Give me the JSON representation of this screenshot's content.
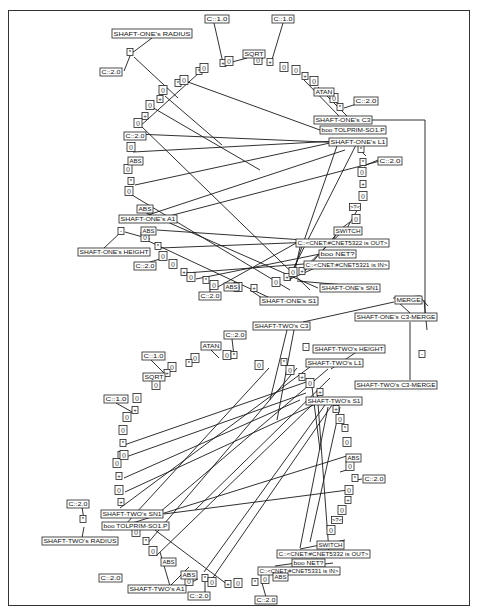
{
  "colors": {
    "line": "#1a1a1a",
    "box_border": "#222222",
    "background": "#ffffff"
  },
  "labels": [
    {
      "id": "s1_radius",
      "text": "SHAFT-ONE's RADIUS",
      "x": 112,
      "y": 29,
      "w": 80,
      "h": 9
    },
    {
      "id": "s1_c1a",
      "text": "C::1.0",
      "x": 205,
      "y": 15,
      "w": 24,
      "h": 8
    },
    {
      "id": "s1_c1b",
      "text": "C::1.0",
      "x": 272,
      "y": 15,
      "w": 22,
      "h": 8
    },
    {
      "id": "s1_sqrt",
      "text": "SQRT",
      "x": 243,
      "y": 50,
      "w": 22,
      "h": 8
    },
    {
      "id": "s1_c2a",
      "text": "C::2.0",
      "x": 100,
      "y": 68,
      "w": 22,
      "h": 8
    },
    {
      "id": "s1_atan",
      "text": "ATAN",
      "x": 314,
      "y": 88,
      "w": 20,
      "h": 8
    },
    {
      "id": "s1_c2b",
      "text": "C::2.0",
      "x": 354,
      "y": 97,
      "w": 24,
      "h": 8
    },
    {
      "id": "s1_c3",
      "text": "SHAFT-ONE's C3",
      "x": 314,
      "y": 116,
      "w": 58,
      "h": 8
    },
    {
      "id": "s1_tolprim",
      "text": "boo TOLPRIM-SO1.P",
      "x": 320,
      "y": 126,
      "w": 66,
      "h": 8
    },
    {
      "id": "s1_l1",
      "text": "SHAFT-ONE's L1",
      "x": 329,
      "y": 138,
      "w": 58,
      "h": 8
    },
    {
      "id": "s1_c2c",
      "text": "C::2.0",
      "x": 124,
      "y": 132,
      "w": 22,
      "h": 8
    },
    {
      "id": "s1_abs1",
      "text": "ABS",
      "x": 128,
      "y": 157,
      "w": 15,
      "h": 8
    },
    {
      "id": "s1_c2d",
      "text": "C::2.0",
      "x": 378,
      "y": 157,
      "w": 24,
      "h": 8
    },
    {
      "id": "s1_abs2",
      "text": "ABS",
      "x": 137,
      "y": 205,
      "w": 16,
      "h": 8
    },
    {
      "id": "s1_a1",
      "text": "SHAFT-ONE's A1",
      "x": 119,
      "y": 215,
      "w": 58,
      "h": 8
    },
    {
      "id": "s1_abs3",
      "text": "ABS",
      "x": 141,
      "y": 227,
      "w": 15,
      "h": 8
    },
    {
      "id": "s1_height",
      "text": "SHAFT-ONE's HEIGHT",
      "x": 78,
      "y": 248,
      "w": 72,
      "h": 8
    },
    {
      "id": "s1_c2e",
      "text": "C::2.0",
      "x": 134,
      "y": 262,
      "w": 22,
      "h": 8
    },
    {
      "id": "s1_switch",
      "text": "SWITCH",
      "x": 334,
      "y": 227,
      "w": 28,
      "h": 8
    },
    {
      "id": "s1_out",
      "text": "C::<CNET:#CNET5322 is OUT>",
      "x": 296,
      "y": 239,
      "w": 93,
      "h": 8
    },
    {
      "id": "s1_net",
      "text": "boo NET?",
      "x": 319,
      "y": 250,
      "w": 37,
      "h": 8
    },
    {
      "id": "s1_in",
      "text": "C::<CNET:#CNET5321 is IN>",
      "x": 304,
      "y": 261,
      "w": 85,
      "h": 8
    },
    {
      "id": "s1_abs4",
      "text": "ABS",
      "x": 224,
      "y": 283,
      "w": 15,
      "h": 8
    },
    {
      "id": "s1_c2f",
      "text": "C::2.0",
      "x": 199,
      "y": 292,
      "w": 22,
      "h": 8
    },
    {
      "id": "s1_sn1",
      "text": "SHAFT-ONE's SN1",
      "x": 320,
      "y": 284,
      "w": 60,
      "h": 8
    },
    {
      "id": "s1_s1",
      "text": "SHAFT-ONE's S1",
      "x": 260,
      "y": 297,
      "w": 58,
      "h": 8
    },
    {
      "id": "merge",
      "text": "MERGE",
      "x": 395,
      "y": 296,
      "w": 27,
      "h": 8
    },
    {
      "id": "s1_c3merge",
      "text": "SHAFT-ONE's C3-MERGE",
      "x": 355,
      "y": 313,
      "w": 82,
      "h": 8
    },
    {
      "id": "s2_c3",
      "text": "SHAFT-TWO's C3",
      "x": 253,
      "y": 322,
      "w": 57,
      "h": 8
    },
    {
      "id": "s2_c2a",
      "text": "C::2.0",
      "x": 224,
      "y": 331,
      "w": 22,
      "h": 8
    },
    {
      "id": "s2_atan",
      "text": "ATAN",
      "x": 201,
      "y": 342,
      "w": 20,
      "h": 8
    },
    {
      "id": "s2_height",
      "text": "SHAFT-TWO's HEIGHT",
      "x": 313,
      "y": 345,
      "w": 72,
      "h": 8
    },
    {
      "id": "s2_c1a",
      "text": "C::1.0",
      "x": 142,
      "y": 352,
      "w": 23,
      "h": 8
    },
    {
      "id": "s2_l1",
      "text": "SHAFT-TWO's L1",
      "x": 306,
      "y": 359,
      "w": 57,
      "h": 8
    },
    {
      "id": "s2_sqrt",
      "text": "SQRT",
      "x": 143,
      "y": 373,
      "w": 22,
      "h": 8
    },
    {
      "id": "s2_c1b",
      "text": "C::1.0",
      "x": 104,
      "y": 395,
      "w": 24,
      "h": 8
    },
    {
      "id": "s2_c3merge",
      "text": "SHAFT-TWO's C3-MERGE",
      "x": 355,
      "y": 381,
      "w": 82,
      "h": 8
    },
    {
      "id": "s2_s1",
      "text": "SHAFT-TWO's S1",
      "x": 306,
      "y": 397,
      "w": 56,
      "h": 8
    },
    {
      "id": "s2_abs1",
      "text": "ABS",
      "x": 346,
      "y": 454,
      "w": 15,
      "h": 8
    },
    {
      "id": "s2_c2b",
      "text": "C::2.0",
      "x": 363,
      "y": 475,
      "w": 22,
      "h": 8
    },
    {
      "id": "s2_c2c",
      "text": "C::2.0",
      "x": 67,
      "y": 500,
      "w": 22,
      "h": 8
    },
    {
      "id": "s2_sn1",
      "text": "SHAFT-TWO's SN1",
      "x": 101,
      "y": 510,
      "w": 62,
      "h": 8
    },
    {
      "id": "s2_tolprim",
      "text": "boo TOLPRIM-SO1.P",
      "x": 102,
      "y": 522,
      "w": 67,
      "h": 8
    },
    {
      "id": "s2_radius",
      "text": "SHAFT-TWO's RADIUS",
      "x": 42,
      "y": 537,
      "w": 76,
      "h": 8
    },
    {
      "id": "s2_switch",
      "text": "SWITCH",
      "x": 317,
      "y": 541,
      "w": 27,
      "h": 8
    },
    {
      "id": "s2_out",
      "text": "C::<CNET:#CNET5332 is OUT>",
      "x": 277,
      "y": 550,
      "w": 93,
      "h": 8
    },
    {
      "id": "s2_net",
      "text": "boo NET?",
      "x": 292,
      "y": 559,
      "w": 33,
      "h": 8
    },
    {
      "id": "s2_in",
      "text": "C::<CNET:#CNET5331 is IN>",
      "x": 258,
      "y": 567,
      "w": 82,
      "h": 8
    },
    {
      "id": "s2_abs2",
      "text": "ABS",
      "x": 161,
      "y": 558,
      "w": 15,
      "h": 8
    },
    {
      "id": "s2_abs3",
      "text": "ABS",
      "x": 181,
      "y": 571,
      "w": 16,
      "h": 8
    },
    {
      "id": "s2_abs4",
      "text": "ABS",
      "x": 273,
      "y": 573,
      "w": 15,
      "h": 8
    },
    {
      "id": "s2_c2d",
      "text": "C::2.0",
      "x": 99,
      "y": 574,
      "w": 23,
      "h": 8
    },
    {
      "id": "s2_a1",
      "text": "SHAFT-TWO's A1",
      "x": 128,
      "y": 585,
      "w": 58,
      "h": 8
    },
    {
      "id": "s2_c2e",
      "text": "C::2.0",
      "x": 188,
      "y": 592,
      "w": 22,
      "h": 8
    },
    {
      "id": "s2_c2f",
      "text": "C::2.0",
      "x": 255,
      "y": 596,
      "w": 22,
      "h": 8
    }
  ],
  "operators": [
    {
      "t": "*",
      "x": 130,
      "y": 52
    },
    {
      "t": "*",
      "x": 199,
      "y": 71
    },
    {
      "t": "()",
      "x": 204,
      "y": 68
    },
    {
      "t": "+",
      "x": 223,
      "y": 63
    },
    {
      "t": "()",
      "x": 229,
      "y": 61
    },
    {
      "t": "()",
      "x": 258,
      "y": 60
    },
    {
      "t": "+",
      "x": 270,
      "y": 62
    },
    {
      "t": "()",
      "x": 284,
      "y": 67
    },
    {
      "t": "()",
      "x": 296,
      "y": 70
    },
    {
      "t": "+",
      "x": 305,
      "y": 76
    },
    {
      "t": "()",
      "x": 314,
      "y": 81
    },
    {
      "t": "()",
      "x": 334,
      "y": 98
    },
    {
      "t": "*",
      "x": 340,
      "y": 107
    },
    {
      "t": "*",
      "x": 178,
      "y": 83
    },
    {
      "t": "()",
      "x": 184,
      "y": 80
    },
    {
      "t": "()",
      "x": 163,
      "y": 90
    },
    {
      "t": "+",
      "x": 160,
      "y": 99
    },
    {
      "t": "()",
      "x": 150,
      "y": 105
    },
    {
      "t": "+",
      "x": 145,
      "y": 116
    },
    {
      "t": "()",
      "x": 138,
      "y": 123
    },
    {
      "t": "*",
      "x": 136,
      "y": 136
    },
    {
      "t": "()",
      "x": 131,
      "y": 147
    },
    {
      "t": "()",
      "x": 128,
      "y": 169
    },
    {
      "t": "*",
      "x": 131,
      "y": 181
    },
    {
      "t": "()",
      "x": 129,
      "y": 191
    },
    {
      "t": "-",
      "x": 121,
      "y": 231
    },
    {
      "t": "()",
      "x": 145,
      "y": 237
    },
    {
      "t": "*",
      "x": 158,
      "y": 246
    },
    {
      "t": "()",
      "x": 163,
      "y": 256
    },
    {
      "t": "()",
      "x": 173,
      "y": 264
    },
    {
      "t": "+",
      "x": 184,
      "y": 272
    },
    {
      "t": "()",
      "x": 191,
      "y": 277
    },
    {
      "t": "*",
      "x": 206,
      "y": 280
    },
    {
      "t": "()",
      "x": 214,
      "y": 285
    },
    {
      "t": "()",
      "x": 238,
      "y": 287
    },
    {
      "t": "+",
      "x": 254,
      "y": 288
    },
    {
      "t": "()",
      "x": 276,
      "y": 282
    },
    {
      "t": "+",
      "x": 287,
      "y": 277
    },
    {
      "t": "()",
      "x": 293,
      "y": 272
    },
    {
      "t": "+",
      "x": 302,
      "y": 271
    },
    {
      "t": "*",
      "x": 361,
      "y": 149
    },
    {
      "t": "*",
      "x": 363,
      "y": 162
    },
    {
      "t": "()",
      "x": 362,
      "y": 172
    },
    {
      "t": "+",
      "x": 363,
      "y": 184
    },
    {
      "t": "()",
      "x": 363,
      "y": 196
    },
    {
      "t": ">?<",
      "x": 355,
      "y": 207
    },
    {
      "t": "()",
      "x": 356,
      "y": 219
    },
    {
      "t": "-",
      "x": 422,
      "y": 354
    },
    {
      "t": "-",
      "x": 306,
      "y": 347
    },
    {
      "t": "()",
      "x": 227,
      "y": 355
    },
    {
      "t": "*",
      "x": 234,
      "y": 355
    },
    {
      "t": "()",
      "x": 195,
      "y": 358
    },
    {
      "t": "*",
      "x": 189,
      "y": 363
    },
    {
      "t": "()",
      "x": 172,
      "y": 367
    },
    {
      "t": "+",
      "x": 167,
      "y": 373
    },
    {
      "t": "()",
      "x": 156,
      "y": 385
    },
    {
      "t": "()",
      "x": 137,
      "y": 398
    },
    {
      "t": "+",
      "x": 135,
      "y": 410
    },
    {
      "t": "()",
      "x": 127,
      "y": 417
    },
    {
      "t": "()",
      "x": 123,
      "y": 430
    },
    {
      "t": "*",
      "x": 123,
      "y": 443
    },
    {
      "t": "*",
      "x": 121,
      "y": 455
    },
    {
      "t": "()",
      "x": 117,
      "y": 463
    },
    {
      "t": "+",
      "x": 119,
      "y": 476
    },
    {
      "t": "()",
      "x": 119,
      "y": 490
    },
    {
      "t": "+",
      "x": 121,
      "y": 502
    },
    {
      "t": "()",
      "x": 124,
      "y": 455
    },
    {
      "t": "()",
      "x": 259,
      "y": 365
    },
    {
      "t": "*",
      "x": 284,
      "y": 362
    },
    {
      "t": "()",
      "x": 290,
      "y": 370
    },
    {
      "t": "+",
      "x": 302,
      "y": 377
    },
    {
      "t": "()",
      "x": 310,
      "y": 383
    },
    {
      "t": "+",
      "x": 320,
      "y": 392
    },
    {
      "t": "+",
      "x": 336,
      "y": 409
    },
    {
      "t": "()",
      "x": 340,
      "y": 419
    },
    {
      "t": "*",
      "x": 345,
      "y": 428
    },
    {
      "t": "()",
      "x": 347,
      "y": 442
    },
    {
      "t": "()",
      "x": 350,
      "y": 466
    },
    {
      "t": "*",
      "x": 355,
      "y": 478
    },
    {
      "t": "()",
      "x": 349,
      "y": 490
    },
    {
      "t": "+",
      "x": 348,
      "y": 500
    },
    {
      "t": "()",
      "x": 342,
      "y": 510
    },
    {
      "t": ">?<",
      "x": 337,
      "y": 520
    },
    {
      "t": "()",
      "x": 331,
      "y": 530
    },
    {
      "t": "*",
      "x": 83,
      "y": 519
    },
    {
      "t": "()",
      "x": 136,
      "y": 532
    },
    {
      "t": "*",
      "x": 146,
      "y": 541
    },
    {
      "t": "()",
      "x": 153,
      "y": 551
    },
    {
      "t": "()",
      "x": 189,
      "y": 581
    },
    {
      "t": "*",
      "x": 205,
      "y": 578
    },
    {
      "t": "()",
      "x": 212,
      "y": 582
    },
    {
      "t": "+",
      "x": 228,
      "y": 584
    },
    {
      "t": "()",
      "x": 238,
      "y": 583
    },
    {
      "t": "*",
      "x": 255,
      "y": 582
    },
    {
      "t": "()",
      "x": 265,
      "y": 579
    }
  ],
  "edges": [
    [
      152,
      38,
      132,
      53
    ],
    [
      124,
      71,
      130,
      56
    ],
    [
      134,
      57,
      178,
      98
    ],
    [
      214,
      23,
      223,
      63
    ],
    [
      283,
      23,
      271,
      63
    ],
    [
      247,
      58,
      232,
      62
    ],
    [
      263,
      58,
      260,
      61
    ],
    [
      200,
      72,
      138,
      128
    ],
    [
      304,
      80,
      340,
      117
    ],
    [
      318,
      87,
      348,
      117
    ],
    [
      363,
      102,
      344,
      108
    ],
    [
      188,
      82,
      320,
      130
    ],
    [
      165,
      96,
      222,
      145
    ],
    [
      150,
      106,
      260,
      170
    ],
    [
      140,
      125,
      310,
      290
    ],
    [
      136,
      134,
      348,
      143
    ],
    [
      133,
      152,
      355,
      140
    ],
    [
      135,
      185,
      330,
      143
    ],
    [
      132,
      195,
      290,
      290
    ],
    [
      140,
      210,
      318,
      288
    ],
    [
      145,
      216,
      345,
      150
    ],
    [
      150,
      221,
      380,
      161
    ],
    [
      157,
      230,
      333,
      242
    ],
    [
      144,
      239,
      270,
      298
    ],
    [
      186,
      273,
      330,
      262
    ],
    [
      160,
      248,
      340,
      241
    ],
    [
      196,
      279,
      330,
      252
    ],
    [
      216,
      288,
      298,
      242
    ],
    [
      300,
      272,
      345,
      229
    ],
    [
      304,
      272,
      340,
      230
    ],
    [
      294,
      275,
      300,
      247
    ],
    [
      290,
      281,
      338,
      143
    ],
    [
      287,
      281,
      357,
      143
    ],
    [
      288,
      280,
      324,
      264
    ],
    [
      297,
      281,
      345,
      285
    ],
    [
      250,
      290,
      262,
      298
    ],
    [
      121,
      232,
      103,
      249
    ],
    [
      150,
      239,
      125,
      232
    ],
    [
      163,
      258,
      147,
      263
    ],
    [
      210,
      283,
      210,
      293
    ],
    [
      362,
      152,
      366,
      156
    ],
    [
      364,
      166,
      378,
      160
    ],
    [
      360,
      205,
      346,
      230
    ],
    [
      350,
      222,
      338,
      231
    ],
    [
      338,
      231,
      333,
      240
    ],
    [
      372,
      120,
      425,
      120
    ],
    [
      425,
      120,
      425,
      320
    ],
    [
      428,
      306,
      420,
      297
    ],
    [
      420,
      296,
      393,
      298
    ],
    [
      424,
      300,
      427,
      330
    ],
    [
      394,
      302,
      303,
      322
    ],
    [
      398,
      302,
      410,
      313
    ],
    [
      410,
      322,
      410,
      380
    ],
    [
      287,
      330,
      270,
      400
    ],
    [
      294,
      330,
      277,
      420
    ],
    [
      232,
      339,
      234,
      356
    ],
    [
      211,
      350,
      219,
      358
    ],
    [
      151,
      360,
      165,
      374
    ],
    [
      116,
      403,
      134,
      413
    ],
    [
      364,
      347,
      331,
      369
    ],
    [
      328,
      369,
      160,
      512
    ],
    [
      310,
      367,
      120,
      508
    ],
    [
      269,
      368,
      125,
      525
    ],
    [
      297,
      368,
      147,
      544
    ],
    [
      312,
      405,
      156,
      556
    ],
    [
      325,
      405,
      204,
      572
    ],
    [
      332,
      405,
      212,
      579
    ],
    [
      340,
      407,
      310,
      542
    ],
    [
      328,
      407,
      300,
      548
    ],
    [
      312,
      387,
      320,
      450
    ],
    [
      317,
      390,
      329,
      552
    ],
    [
      350,
      455,
      110,
      530
    ],
    [
      348,
      490,
      164,
      514
    ],
    [
      340,
      472,
      350,
      469
    ],
    [
      362,
      479,
      356,
      480
    ],
    [
      124,
      445,
      312,
      380
    ],
    [
      123,
      458,
      306,
      393
    ],
    [
      124,
      478,
      300,
      400
    ],
    [
      125,
      492,
      320,
      402
    ],
    [
      195,
      510,
      330,
      378
    ],
    [
      82,
      507,
      84,
      520
    ],
    [
      84,
      527,
      82,
      538
    ],
    [
      155,
      530,
      228,
      585
    ],
    [
      160,
      552,
      170,
      586
    ],
    [
      189,
      567,
      170,
      586
    ],
    [
      186,
      585,
      198,
      579
    ],
    [
      205,
      582,
      205,
      592
    ],
    [
      262,
      583,
      266,
      597
    ],
    [
      317,
      559,
      282,
      572
    ],
    [
      345,
      540,
      300,
      549
    ],
    [
      275,
      566,
      297,
      563
    ],
    [
      300,
      567,
      333,
      563
    ]
  ],
  "frame_lines": [
    [
      372,
      120,
      425,
      120
    ],
    [
      425,
      120,
      425,
      125
    ],
    [
      425,
      125,
      423,
      300
    ]
  ]
}
